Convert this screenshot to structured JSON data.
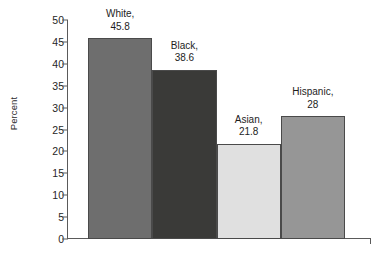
{
  "chart_data": {
    "type": "bar",
    "title": "",
    "subtitle": "",
    "xlabel": "",
    "ylabel": "Percent",
    "categories": [
      "White",
      "Black",
      "Asian",
      "Hispanic"
    ],
    "values": [
      45.8,
      38.6,
      21.8,
      28
    ],
    "value_labels": [
      "45.8",
      "38.6",
      "21.8",
      "28"
    ],
    "point_labels": [
      "White,",
      "Black,",
      "Asian,",
      "Hispanic,"
    ],
    "ylim": [
      0,
      50
    ],
    "ytick_values": [
      50,
      45,
      40,
      35,
      30,
      25,
      20,
      15,
      10,
      5,
      0
    ],
    "ytick_labels": [
      "50",
      "45",
      "40",
      "35",
      "30",
      "25",
      "20",
      "15",
      "10",
      "5",
      "0"
    ],
    "xtick_labels": [],
    "grid": false,
    "legend": false,
    "legend_position": "none",
    "bar_colors": [
      "#6e6e6e",
      "#3a3a38",
      "#e0e0e0",
      "#969696"
    ],
    "bar_border_color": "#4a4a4a",
    "axis_color": "#5a5a5a",
    "background_color": "#ffffff",
    "text_color": "#1d1d1d",
    "labels_above_bars": true,
    "bars_adjacent": true
  }
}
